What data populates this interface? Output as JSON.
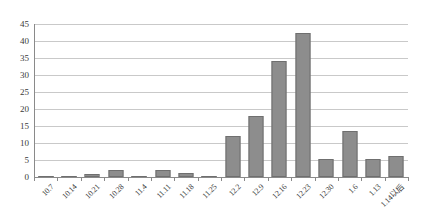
{
  "chart_data": {
    "type": "bar",
    "title": "",
    "subtitle": "",
    "xlabel": "",
    "ylabel": "",
    "ylim": [
      0,
      45
    ],
    "ytick_step": 5,
    "yticks": [
      0,
      5,
      10,
      15,
      20,
      25,
      30,
      35,
      40,
      45
    ],
    "grid": true,
    "legend": false,
    "legend_position": "none",
    "bar_color": "#8d8d8d",
    "bar_border_color": "#6f6f6f",
    "gridline_color": "#c9c9c9",
    "axis_color": "#8a8a8a",
    "categories": [
      "10.7",
      "10.14",
      "10.21",
      "10.28",
      "11.4",
      "11.11",
      "11.18",
      "11.25",
      "12.2",
      "12.9",
      "12.16",
      "12.23",
      "12.30",
      "1.6",
      "1.13",
      "1.14以后"
    ],
    "values": [
      0.3,
      0.4,
      1,
      2,
      0.4,
      2,
      1.2,
      0.3,
      12,
      17.8,
      34,
      42.5,
      5.4,
      13.5,
      5.4,
      6.3
    ]
  }
}
